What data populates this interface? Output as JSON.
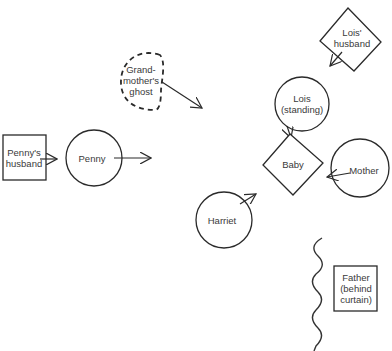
{
  "diagram": {
    "type": "family-constellation",
    "stroke_color": "#2a2a2a",
    "background": "#ffffff",
    "nodes": [
      {
        "id": "pennys_husband",
        "label": "Penny's\nhusband",
        "shape": "square"
      },
      {
        "id": "penny",
        "label": "Penny",
        "shape": "circle"
      },
      {
        "id": "grandmothers_ghost",
        "label": "Grand-\nmother's\nghost",
        "shape": "dashed-half-circle"
      },
      {
        "id": "lois_husband",
        "label": "Lois'\nhusband",
        "shape": "diamond"
      },
      {
        "id": "lois",
        "label": "Lois\n(standing)",
        "shape": "circle"
      },
      {
        "id": "baby",
        "label": "Baby",
        "shape": "diamond"
      },
      {
        "id": "mother",
        "label": "Mother",
        "shape": "circle"
      },
      {
        "id": "harriet",
        "label": "Harriet",
        "shape": "circle"
      },
      {
        "id": "father",
        "label": "Father\n(behind\ncurtain)",
        "shape": "square"
      }
    ],
    "edges": [
      {
        "from": "pennys_husband",
        "to": "penny"
      },
      {
        "from": "penny",
        "to": "center"
      },
      {
        "from": "grandmothers_ghost",
        "to": "center"
      },
      {
        "from": "lois_husband",
        "to": "lois"
      },
      {
        "from": "lois",
        "to": "baby"
      },
      {
        "from": "mother",
        "to": "baby"
      },
      {
        "from": "harriet",
        "to": "baby"
      }
    ],
    "decorations": [
      {
        "id": "curtain",
        "shape": "wavy-line",
        "description": "curtain separating Father"
      }
    ]
  }
}
